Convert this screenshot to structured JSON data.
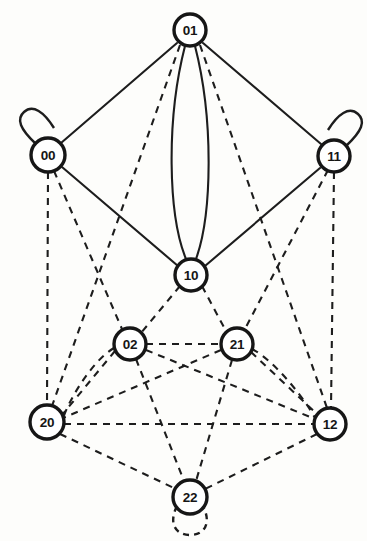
{
  "figure": {
    "width": 367,
    "height": 541,
    "background_color": "#fdfdfb",
    "stroke_color": "#1d1d1d",
    "node_fill_color": "#ffffff"
  },
  "nodes": [
    {
      "id": "n01",
      "label": "01",
      "x": 190,
      "y": 30,
      "r": 16
    },
    {
      "id": "n00",
      "label": "00",
      "x": 48,
      "y": 155,
      "r": 17
    },
    {
      "id": "n11",
      "label": "11",
      "x": 334,
      "y": 156,
      "r": 16
    },
    {
      "id": "n10",
      "label": "10",
      "x": 191,
      "y": 275,
      "r": 16
    },
    {
      "id": "n02",
      "label": "02",
      "x": 130,
      "y": 344,
      "r": 16
    },
    {
      "id": "n21",
      "label": "21",
      "x": 237,
      "y": 344,
      "r": 16
    },
    {
      "id": "n20",
      "label": "20",
      "x": 47,
      "y": 422,
      "r": 17
    },
    {
      "id": "n12",
      "label": "12",
      "x": 330,
      "y": 424,
      "r": 16
    },
    {
      "id": "n22",
      "label": "22",
      "x": 190,
      "y": 497,
      "r": 17
    }
  ],
  "edges": [
    {
      "from": "01",
      "to": "00",
      "style": "solid",
      "path": "M 177 43 L 61 143"
    },
    {
      "from": "01",
      "to": "11",
      "style": "solid",
      "path": "M 203 43 L 321 144"
    },
    {
      "from": "01",
      "to": "10",
      "style": "solid",
      "path": "M 185 46 C 166 120, 168 215, 186 259",
      "curve": "left"
    },
    {
      "from": "01",
      "to": "10",
      "style": "solid",
      "path": "M 195 46 C 214 120, 212 215, 196 259",
      "curve": "right"
    },
    {
      "from": "00",
      "to": "10",
      "style": "solid",
      "path": "M 62 167 L 178 266"
    },
    {
      "from": "11",
      "to": "10",
      "style": "solid",
      "path": "M 320 168 L 205 266"
    },
    {
      "from": "01",
      "to": "20",
      "style": "dashed",
      "path": "M 180 45 L 52 406"
    },
    {
      "from": "01",
      "to": "12",
      "style": "dashed",
      "path": "M 200 45 L 327 408"
    },
    {
      "from": "00",
      "to": "20",
      "style": "dashed",
      "path": "M 48 172 L 47 405"
    },
    {
      "from": "00",
      "to": "02",
      "style": "dashed",
      "path": "M 54 171 L 122 329"
    },
    {
      "from": "11",
      "to": "12",
      "style": "dashed",
      "path": "M 334 172 L 331 408"
    },
    {
      "from": "11",
      "to": "21",
      "style": "dashed",
      "path": "M 328 170 L 245 329"
    },
    {
      "from": "10",
      "to": "02",
      "style": "dashed",
      "path": "M 180 286 L 141 333"
    },
    {
      "from": "10",
      "to": "21",
      "style": "dashed",
      "path": "M 202 286 L 227 333"
    },
    {
      "from": "02",
      "to": "21",
      "style": "dashed",
      "path": "M 146 344 L 221 344"
    },
    {
      "from": "02",
      "to": "20",
      "style": "dashed",
      "path": "M 115 351 L 62 415"
    },
    {
      "from": "02",
      "to": "20",
      "style": "dashed",
      "path": "M 114 348 C 90 362, 66 406, 63 419"
    },
    {
      "from": "02",
      "to": "22",
      "style": "dashed",
      "path": "M 136 359 L 184 481"
    },
    {
      "from": "02",
      "to": "12",
      "style": "dashed",
      "path": "M 146 350 L 315 419"
    },
    {
      "from": "21",
      "to": "20",
      "style": "dashed",
      "path": "M 221 350 L 63 418"
    },
    {
      "from": "21",
      "to": "12",
      "style": "dashed",
      "path": "M 251 352 L 317 414"
    },
    {
      "from": "21",
      "to": "12",
      "style": "dashed",
      "path": "M 252 349 C 277 362, 308 404, 315 418"
    },
    {
      "from": "21",
      "to": "22",
      "style": "dashed",
      "path": "M 232 360 L 196 481"
    },
    {
      "from": "20",
      "to": "12",
      "style": "dashed",
      "path": "M 64 424 L 313 424"
    },
    {
      "from": "20",
      "to": "22",
      "style": "dashed",
      "path": "M 60 434 L 176 489"
    },
    {
      "from": "12",
      "to": "22",
      "style": "dashed",
      "path": "M 317 434 L 205 489"
    },
    {
      "from": "00",
      "to": "00",
      "style": "solid",
      "loop": true
    },
    {
      "from": "11",
      "to": "11",
      "style": "solid",
      "loop": true
    },
    {
      "from": "22",
      "to": "22",
      "style": "dashed",
      "loop": true
    }
  ],
  "self_loops": [
    {
      "node": "00",
      "style": "solid",
      "direction": "up-left",
      "path": "M 36 144 C 20 129, 16 119, 24 112 C 33 104, 44 112, 54 128"
    },
    {
      "node": "11",
      "style": "solid",
      "direction": "up-right",
      "path": "M 346 146 C 362 131, 366 121, 358 114 C 349 106, 338 114, 328 130"
    },
    {
      "node": "22",
      "style": "dashed",
      "direction": "down",
      "path": "M 177 506 C 168 524, 176 535, 190 535 C 204 535, 212 524, 203 506"
    }
  ],
  "legend": {
    "solid_meaning": "solid edge",
    "dashed_meaning": "dashed edge"
  }
}
